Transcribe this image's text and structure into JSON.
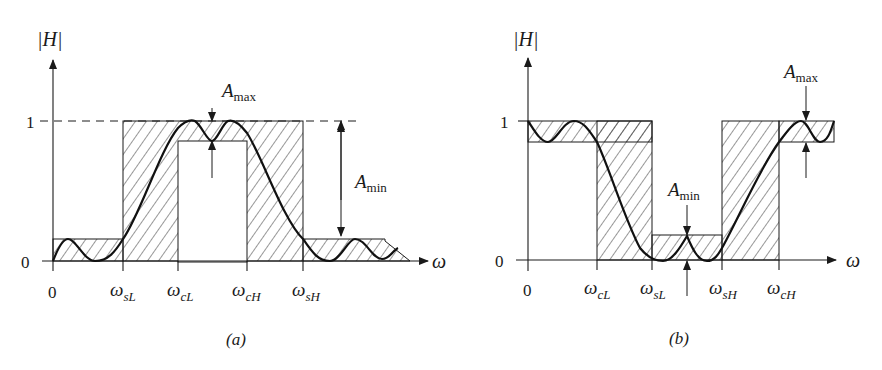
{
  "figure": {
    "panels": [
      {
        "id": "a",
        "caption": "(a)",
        "filter_type": "band-pass",
        "y_axis_label": "|H|",
        "x_axis_label": "ω",
        "y_ticks": [
          "1",
          "0"
        ],
        "x_ticks": [
          {
            "label": "0",
            "sym": "",
            "sub": ""
          },
          {
            "label": "ωsL",
            "sym": "ω",
            "sub": "sL"
          },
          {
            "label": "ωcL",
            "sym": "ω",
            "sub": "cL"
          },
          {
            "label": "ωcH",
            "sym": "ω",
            "sub": "cH"
          },
          {
            "label": "ωsH",
            "sym": "ω",
            "sub": "sH"
          }
        ],
        "annotations": {
          "amax": {
            "base": "A",
            "sub": "max"
          },
          "amin": {
            "base": "A",
            "sub": "min"
          }
        }
      },
      {
        "id": "b",
        "caption": "(b)",
        "filter_type": "band-stop",
        "y_axis_label": "|H|",
        "x_axis_label": "ω",
        "y_ticks": [
          "1",
          "0"
        ],
        "x_ticks": [
          {
            "label": "0",
            "sym": "",
            "sub": ""
          },
          {
            "label": "ωcL",
            "sym": "ω",
            "sub": "cL"
          },
          {
            "label": "ωsL",
            "sym": "ω",
            "sub": "sL"
          },
          {
            "label": "ωsH",
            "sym": "ω",
            "sub": "sH"
          },
          {
            "label": "ωcH",
            "sym": "ω",
            "sub": "cH"
          }
        ],
        "annotations": {
          "amax": {
            "base": "A",
            "sub": "max"
          },
          "amin": {
            "base": "A",
            "sub": "min"
          }
        }
      }
    ]
  }
}
